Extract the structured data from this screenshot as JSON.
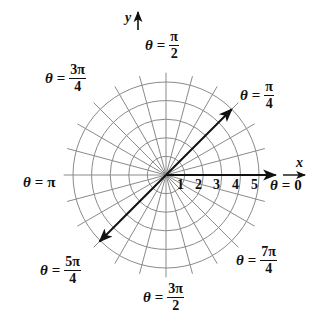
{
  "diagram": {
    "type": "polar-coordinate-grid",
    "center": {
      "x": 166,
      "y": 175
    },
    "unit_px": 18.6,
    "circles": [
      1,
      2,
      3,
      4,
      5
    ],
    "radial_step_deg": 15,
    "radial_extent": 5.5,
    "grid_color": "#8a8a8a",
    "ink_color": "#111111",
    "arrows": [
      {
        "name": "polar-axis-arrow",
        "angle_deg": 0,
        "length": 5.9
      },
      {
        "name": "pi-over-4-arrow",
        "angle_deg": 45,
        "length": 5.0
      },
      {
        "name": "five-pi-over-4-arrow",
        "angle_deg": 225,
        "length": 5.05
      }
    ]
  },
  "axes": {
    "x_label": "x",
    "y_label": "y"
  },
  "ticks": [
    "1",
    "2",
    "3",
    "4",
    "5"
  ],
  "angle_labels": [
    {
      "id": "zero",
      "theta": "θ",
      "eq": "=",
      "value": "0"
    },
    {
      "id": "pi_over_4",
      "theta": "θ",
      "eq": "=",
      "num": "π",
      "den": "4"
    },
    {
      "id": "pi_over_2",
      "theta": "θ",
      "eq": "=",
      "num": "π",
      "den": "2"
    },
    {
      "id": "three_pi_over_4",
      "theta": "θ",
      "eq": "=",
      "num": "3π",
      "den": "4"
    },
    {
      "id": "pi",
      "theta": "θ",
      "eq": "=",
      "value": "π"
    },
    {
      "id": "five_pi_over_4",
      "theta": "θ",
      "eq": "=",
      "num": "5π",
      "den": "4"
    },
    {
      "id": "three_pi_over_2",
      "theta": "θ",
      "eq": "=",
      "num": "3π",
      "den": "2"
    },
    {
      "id": "seven_pi_over_4",
      "theta": "θ",
      "eq": "=",
      "num": "7π",
      "den": "4"
    }
  ]
}
